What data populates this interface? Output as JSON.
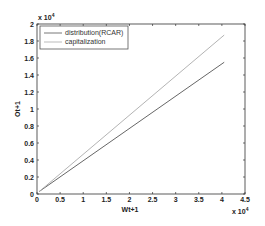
{
  "chart_data": {
    "type": "line",
    "title": "",
    "xlabel": "Wt+1",
    "ylabel": "Ot+1",
    "x_multiplier": "x 10^4",
    "y_multiplier": "x 10^4",
    "xlim": [
      0,
      4.5
    ],
    "ylim": [
      0,
      2
    ],
    "xticks": [
      "0",
      "0.5",
      "1",
      "1.5",
      "2",
      "2.5",
      "3",
      "3.5",
      "4",
      "4.5"
    ],
    "yticks": [
      "0",
      "0.2",
      "0.4",
      "0.6",
      "0.8",
      "1",
      "1.2",
      "1.4",
      "1.6",
      "1.8",
      "2"
    ],
    "grid": false,
    "legend_position": "upper left",
    "series": [
      {
        "name": "distribution(RCAR)",
        "color": "#555555",
        "x": [
          0.05,
          4.05
        ],
        "y": [
          0.03,
          1.55
        ]
      },
      {
        "name": "capitalization",
        "color": "#aaaaaa",
        "x": [
          0.05,
          4.05
        ],
        "y": [
          0.03,
          1.87
        ]
      }
    ]
  },
  "labels": {
    "xlabel": "Wt+1",
    "ylabel": "Ot+1",
    "x_exp_base": "x 10",
    "x_exp_pow": "4",
    "y_exp_base": "x 10",
    "y_exp_pow": "4",
    "legend_0": "distribution(RCAR)",
    "legend_1": "capitalization"
  }
}
